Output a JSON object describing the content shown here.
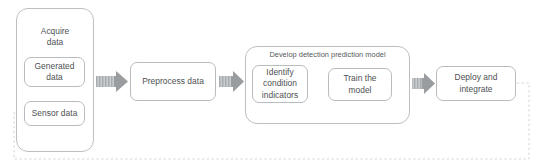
{
  "diagram": {
    "colors": {
      "node_border": "#b9bcbe",
      "node_text": "#4c4f52",
      "group_border": "#bcbfc1",
      "arrow_fill": "#9a9da0",
      "arrow_hatch": "#c9ccce",
      "feedback_dash": "#cfd2d4",
      "background": "#ffffff"
    },
    "groups": [
      {
        "id": "acquire",
        "label": "Acquire\ndata",
        "label_line1": "Acquire",
        "label_line2": "data"
      },
      {
        "id": "develop",
        "label": "Develop detection prediction model"
      }
    ],
    "nodes": [
      {
        "id": "generated",
        "label_line1": "Generated",
        "label_line2": "data"
      },
      {
        "id": "sensor",
        "label": "Sensor data"
      },
      {
        "id": "preprocess",
        "label": "Preprocess data"
      },
      {
        "id": "identify",
        "label_line1": "Identify",
        "label_line2": "condition",
        "label_line3": "indicators"
      },
      {
        "id": "train",
        "label_line1": "Train the",
        "label_line2": "model"
      },
      {
        "id": "deploy",
        "label_line1": "Deploy and",
        "label_line2": "integrate"
      }
    ],
    "connectors": [
      {
        "id": "acquire-to-preprocess",
        "type": "block-arrow",
        "direction": "right"
      },
      {
        "id": "preprocess-to-develop",
        "type": "block-arrow",
        "direction": "right"
      },
      {
        "id": "identify-to-train",
        "type": "block-arrow",
        "direction": "right"
      },
      {
        "id": "develop-to-deploy",
        "type": "block-arrow",
        "direction": "right"
      },
      {
        "id": "train-to-identify-feedback",
        "type": "dashed-line",
        "direction": "up-left"
      },
      {
        "id": "deploy-to-sensor-feedback",
        "type": "dashed-line",
        "direction": "around-bottom-left"
      }
    ]
  }
}
